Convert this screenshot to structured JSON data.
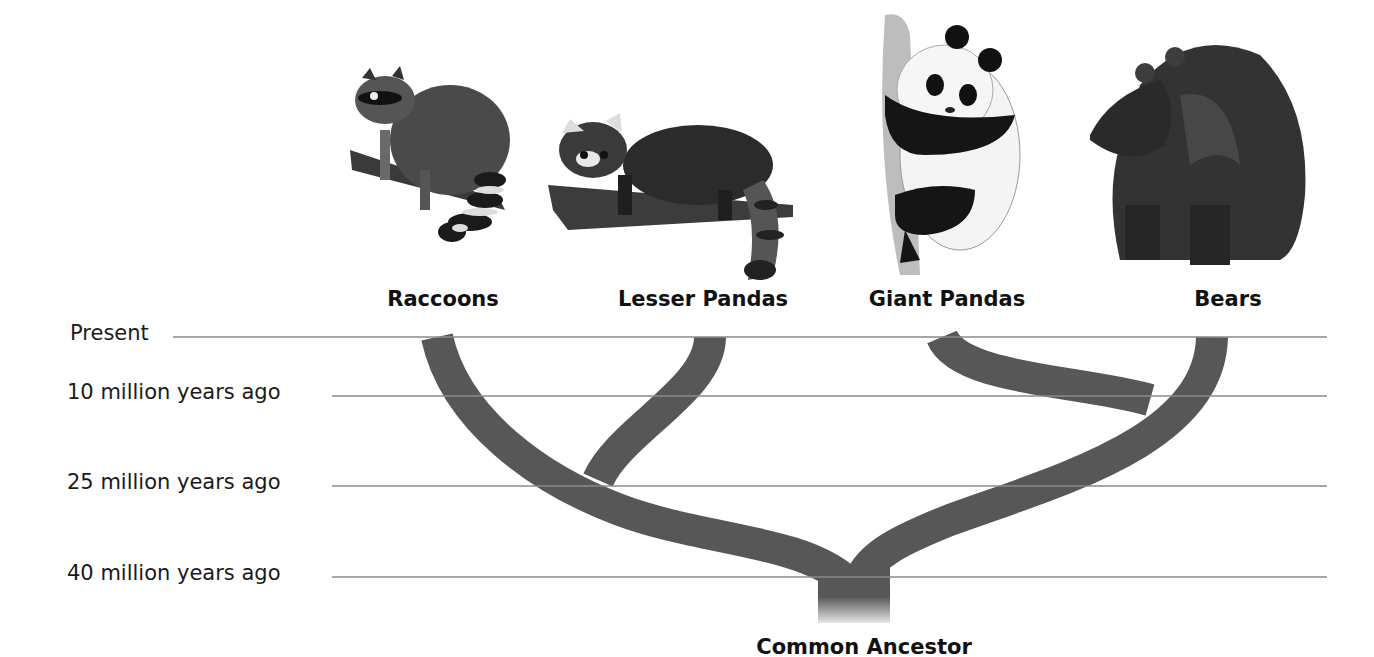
{
  "diagram": {
    "type": "phylogenetic-tree",
    "branch_color": "#575757",
    "line_color": "#8a8a8a",
    "time_axis": [
      {
        "label": "Present",
        "mya": 0
      },
      {
        "label": "10 million years ago",
        "mya": 10
      },
      {
        "label": "25 million years ago",
        "mya": 25
      },
      {
        "label": "40 million years ago",
        "mya": 40
      }
    ],
    "taxa": [
      {
        "label": "Raccoons",
        "illustration": "raccoon-illustration"
      },
      {
        "label": "Lesser Pandas",
        "illustration": "lesser-panda-illustration"
      },
      {
        "label": "Giant Pandas",
        "illustration": "giant-panda-illustration"
      },
      {
        "label": "Bears",
        "illustration": "bear-illustration"
      }
    ],
    "root_label": "Common Ancestor",
    "splits": [
      {
        "between": [
          "Raccoons/Lesser Pandas lineage",
          "Giant Pandas/Bears lineage"
        ],
        "mya": 40
      },
      {
        "between": [
          "Raccoons",
          "Lesser Pandas"
        ],
        "mya": 25
      },
      {
        "between": [
          "Giant Pandas",
          "Bears"
        ],
        "mya": 10
      }
    ]
  }
}
